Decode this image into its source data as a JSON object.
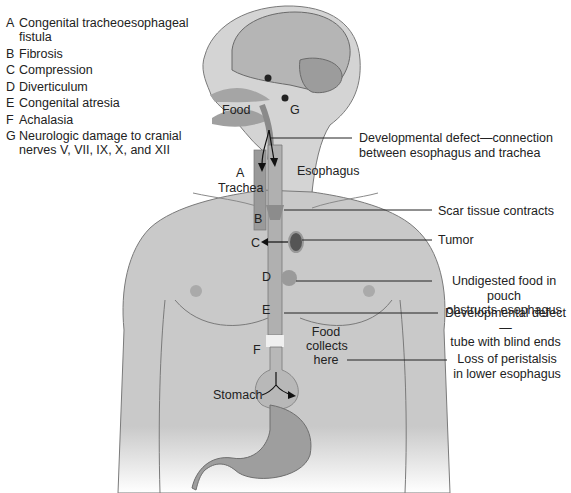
{
  "legend": {
    "items": [
      {
        "key": "A",
        "text": "Congenital tracheoesophageal fistula"
      },
      {
        "key": "B",
        "text": "Fibrosis"
      },
      {
        "key": "C",
        "text": "Compression"
      },
      {
        "key": "D",
        "text": "Diverticulum"
      },
      {
        "key": "E",
        "text": "Congenital atresia"
      },
      {
        "key": "F",
        "text": "Achalasia"
      },
      {
        "key": "G",
        "text": "Neurologic damage to cranial nerves V, VII, IX, X, and XII"
      }
    ]
  },
  "body_labels": {
    "food": "Food",
    "g": "G",
    "a": "A",
    "trachea": "Trachea",
    "esophagus": "Esophagus",
    "b": "B",
    "c": "C",
    "d": "D",
    "e": "E",
    "f": "F",
    "food_collects_1": "Food",
    "food_collects_2": "collects",
    "food_collects_3": "here",
    "stomach": "Stomach"
  },
  "annotations": [
    {
      "id": "fistula",
      "line1": "Developmental defect—connection",
      "line2": "between esophagus and trachea"
    },
    {
      "id": "scar",
      "line1": "Scar tissue contracts"
    },
    {
      "id": "tumor",
      "line1": "Tumor"
    },
    {
      "id": "pouch",
      "line1": "Undigested food in pouch",
      "line2": "obstructs esophagus"
    },
    {
      "id": "atresia",
      "line1": "Developmental defect—",
      "line2": "tube with blind ends"
    },
    {
      "id": "peristalsis",
      "line1": "Loss of peristalsis",
      "line2": "in lower esophagus"
    }
  ],
  "colors": {
    "background": "#ffffff",
    "skin": "#c9c9c9",
    "skin_light": "#dcdcdc",
    "outline": "#7a7a7a",
    "organ": "#a8a8a8",
    "dark": "#222222"
  }
}
